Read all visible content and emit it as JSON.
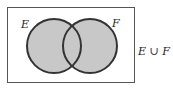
{
  "diagram": {
    "type": "venn",
    "sets": [
      {
        "label": "E",
        "shaded": true
      },
      {
        "label": "F",
        "shaded": true
      }
    ],
    "caption": "E ∪ F",
    "colors": {
      "fill": "#c8c8c8",
      "stroke": "#333333",
      "frame": "#555555"
    }
  }
}
